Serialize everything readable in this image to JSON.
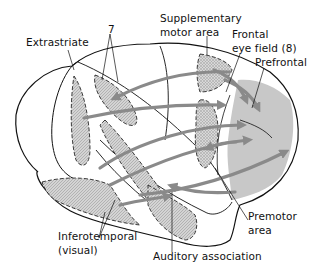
{
  "labels": {
    "extrastriate": "Extrastriate",
    "area7": "7",
    "supplementary_line1": "Supplementary",
    "supplementary_line2": "motor area",
    "fef_line1": "Frontal",
    "fef_line2": "eye field (8)",
    "prefrontal": "Prefrontal",
    "premotor_line1": "Premotor",
    "premotor_line2": "area",
    "inferotemporal_line1": "Inferotemporal",
    "inferotemporal_line2": "(visual)",
    "auditory": "Auditory association"
  },
  "colors": {
    "outline": "#111111",
    "region_fill": "#cfcfcf",
    "prefrontal_fill": "#c8c8c8",
    "arrow": "#8a8a8a",
    "background": "#ffffff"
  }
}
